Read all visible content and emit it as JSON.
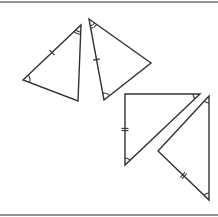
{
  "diagram": {
    "title": "",
    "colors": {
      "stroke": "#333333",
      "frame": "#6e6e6e",
      "background": "#ffffff"
    },
    "triangles": [
      {
        "id": "triangle-1",
        "vertices": [
          [
            23,
            80
          ],
          [
            81,
            25
          ],
          [
            78,
            101
          ]
        ],
        "side_ticks": [
          {
            "side": [
              0,
              1
            ],
            "count": 1
          }
        ],
        "angle_arcs": [
          {
            "vertex": 0,
            "count": 1
          },
          {
            "vertex": 1,
            "count": 2
          }
        ]
      },
      {
        "id": "triangle-2",
        "vertices": [
          [
            89,
            19
          ],
          [
            151,
            63
          ],
          [
            104,
            100
          ]
        ],
        "side_ticks": [
          {
            "side": [
              0,
              2
            ],
            "count": 1
          }
        ],
        "angle_arcs": [
          {
            "vertex": 0,
            "count": 2
          },
          {
            "vertex": 2,
            "count": 1
          }
        ]
      },
      {
        "id": "triangle-3",
        "vertices": [
          [
            125,
            94
          ],
          [
            200,
            94
          ],
          [
            125,
            165
          ]
        ],
        "side_ticks": [
          {
            "side": [
              0,
              2
            ],
            "count": 2
          }
        ],
        "angle_arcs": [
          {
            "vertex": 1,
            "count": 1
          },
          {
            "vertex": 2,
            "count": 1
          }
        ]
      },
      {
        "id": "triangle-4",
        "vertices": [
          [
            209,
            96
          ],
          [
            158,
            151
          ],
          [
            209,
            200
          ]
        ],
        "side_ticks": [
          {
            "side": [
              1,
              2
            ],
            "count": 2
          }
        ],
        "angle_arcs": [
          {
            "vertex": 0,
            "count": 1
          },
          {
            "vertex": 2,
            "count": 1
          }
        ]
      }
    ]
  }
}
